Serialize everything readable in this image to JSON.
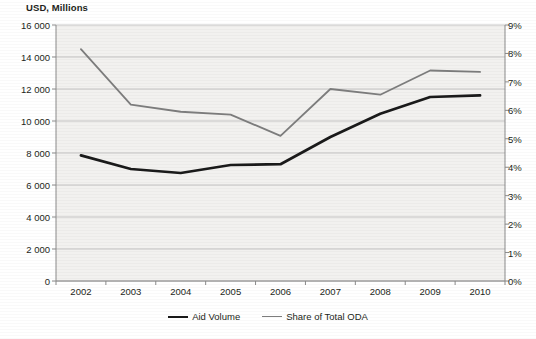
{
  "chart_data": {
    "type": "line",
    "title": "",
    "ylabel": "USD, Millions",
    "xlabel": "",
    "categories": [
      "2002",
      "2003",
      "2004",
      "2005",
      "2006",
      "2007",
      "2008",
      "2009",
      "2010"
    ],
    "ylim": [
      0,
      16000
    ],
    "y2lim": [
      0,
      0.09
    ],
    "yticks": [
      "0",
      "2 000",
      "4 000",
      "6 000",
      "8 000",
      "10 000",
      "12 000",
      "14 000",
      "16 000"
    ],
    "ytick_values": [
      0,
      2000,
      4000,
      6000,
      8000,
      10000,
      12000,
      14000,
      16000
    ],
    "y2ticks": [
      "0%",
      "1%",
      "2%",
      "3%",
      "4%",
      "5%",
      "6%",
      "7%",
      "8%",
      "9%"
    ],
    "y2tick_values": [
      0,
      1,
      2,
      3,
      4,
      5,
      6,
      7,
      8,
      9
    ],
    "grid": true,
    "legend_position": "bottom",
    "series": [
      {
        "name": "Aid Volume",
        "axis": "left",
        "unit": "USD, Millions",
        "color": "#1a1a1a",
        "values": [
          7850,
          7000,
          6750,
          7250,
          7300,
          9000,
          10450,
          11500,
          11600
        ]
      },
      {
        "name": "Share of Total ODA",
        "axis": "right",
        "unit": "percent",
        "color": "#7d7d7d",
        "values": [
          8.15,
          6.2,
          5.95,
          5.85,
          5.1,
          6.75,
          6.55,
          7.4,
          7.35
        ]
      }
    ]
  },
  "legend": {
    "items": [
      {
        "label": "Aid Volume"
      },
      {
        "label": "Share of Total ODA"
      }
    ]
  },
  "colors": {
    "aid_volume": "#1a1a1a",
    "share_of_total_oda": "#7d7d7d",
    "grid": "#b9b9b9",
    "plot_background": "#f2f1ef"
  }
}
